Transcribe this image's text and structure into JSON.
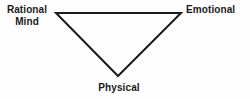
{
  "diagram": {
    "shape": "inverted-triangle",
    "background_color": "#fefefe",
    "stroke_color": "#1a1a1a",
    "text_color": "#1a1a1a",
    "stroke_width": 2,
    "vertices": [
      {
        "id": "rational-mind",
        "label_line_1": "Rational",
        "label_line_2": "Mind",
        "position": "top-left",
        "x": 56,
        "y": 13
      },
      {
        "id": "emotional",
        "label_line_1": "Emotional",
        "label_line_2": "",
        "position": "top-right",
        "x": 181,
        "y": 13
      },
      {
        "id": "physical",
        "label_line_1": "Physical",
        "label_line_2": "",
        "position": "bottom-center",
        "x": 118,
        "y": 76
      }
    ],
    "edges": [
      {
        "id": "edge-top",
        "from": "rational-mind",
        "to": "emotional"
      },
      {
        "id": "edge-left",
        "from": "rational-mind",
        "to": "physical"
      },
      {
        "id": "edge-right",
        "from": "emotional",
        "to": "physical"
      }
    ]
  }
}
